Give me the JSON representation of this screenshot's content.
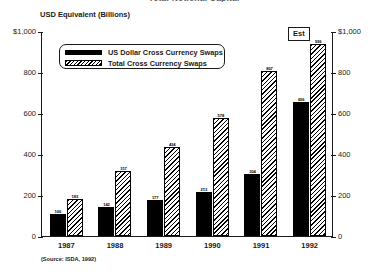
{
  "title": "Total Notional Capital",
  "axis_caption": "USD Equivalent (Billions)",
  "source_note": "(Source: ISDA, 1992)",
  "est_badge": "Est",
  "legend": {
    "items": [
      {
        "label": "US Dollar Cross Currency Swaps",
        "pattern": "solid"
      },
      {
        "label": "Total Cross Currency Swaps",
        "pattern": "hatched"
      }
    ]
  },
  "chart_data": {
    "type": "bar",
    "title": "Total Notional Capital",
    "xlabel": "",
    "ylabel": "USD Equivalent (Billions)",
    "ylim": [
      0,
      1000
    ],
    "yticks": [
      0,
      200,
      400,
      600,
      800,
      1000
    ],
    "ytick_labels": [
      "0",
      "200",
      "400",
      "600",
      "800",
      "$1,000"
    ],
    "ytick_labels_right": [
      "0",
      "200",
      "400",
      "600",
      "800",
      "$1,000"
    ],
    "grid": false,
    "legend_position": "inside-top-left",
    "categories": [
      "1987",
      "1988",
      "1989",
      "1990",
      "1991",
      "1992"
    ],
    "series": [
      {
        "name": "US Dollar Cross Currency Swaps",
        "pattern": "solid",
        "color": "#000000",
        "values": [
          106,
          142,
          177,
          213,
          304,
          656
        ]
      },
      {
        "name": "Total Cross Currency Swaps",
        "pattern": "hatched",
        "color": "#000000",
        "values": [
          183,
          317,
          434,
          578,
          807,
          936
        ]
      }
    ],
    "annotations": [
      {
        "text": "Est",
        "category": "1992"
      }
    ]
  }
}
